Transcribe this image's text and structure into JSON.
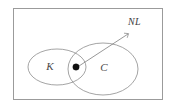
{
  "figure": {
    "title": "",
    "background_color": "#ffffff",
    "frame": {
      "stroke_color": "#9b9b9b",
      "x": 13,
      "y": 8,
      "width": 150,
      "height": 92
    },
    "sets": [
      {
        "id": "set-k",
        "label": "K",
        "label_x": 50,
        "label_y": 67,
        "cx": 57,
        "cy": 67,
        "rx": 29,
        "ry": 18,
        "stroke_color": "#8d8d8d"
      },
      {
        "id": "set-c",
        "label": "C",
        "label_x": 104,
        "label_y": 67,
        "cx": 103,
        "cy": 69,
        "rx": 35,
        "ry": 26,
        "stroke_color": "#8d8d8d"
      }
    ],
    "point": {
      "id": "intersection-point",
      "label": "NL",
      "dot_x": 76,
      "dot_y": 67,
      "dot_radius": 3.2,
      "dot_color": "#101010"
    },
    "pointer": {
      "label": "NL",
      "label_x": 131,
      "label_y": 23,
      "from_x": 79,
      "from_y": 66,
      "to_x": 128,
      "to_y": 34,
      "stroke_color": "#7d7d7d"
    }
  }
}
